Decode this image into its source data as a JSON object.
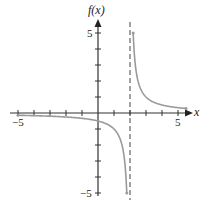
{
  "chart_data": {
    "type": "line",
    "title": "",
    "function": "f(x) = 1/(x - 2)",
    "xlabel": "x",
    "ylabel": "f(x)",
    "xlim": [
      -5,
      5
    ],
    "ylim": [
      -5,
      5
    ],
    "x_tick_labels": [
      "-5",
      "5"
    ],
    "y_tick_labels": [
      "5",
      "-5"
    ],
    "x_ticks": [
      -5,
      -4,
      -3,
      -2,
      -1,
      1,
      2,
      3,
      4,
      5
    ],
    "y_ticks": [
      -5,
      -4,
      -3,
      -2,
      -1,
      1,
      2,
      3,
      4,
      5
    ],
    "grid": false,
    "vertical_asymptote": 2,
    "horizontal_asymptote": 0,
    "series": [
      {
        "name": "left branch",
        "x": [
          -5,
          -3,
          -1,
          0,
          1,
          1.5,
          1.8
        ],
        "y": [
          -0.143,
          -0.2,
          -0.333,
          -0.5,
          -1,
          -2,
          -5
        ]
      },
      {
        "name": "right branch",
        "x": [
          2.2,
          2.5,
          3,
          4,
          5
        ],
        "y": [
          5,
          2,
          1,
          0.5,
          0.333
        ]
      }
    ],
    "curve_color": "#9a9a9a",
    "axis_color": "#333333"
  },
  "labels": {
    "y_axis": "f(x)",
    "x_axis": "x",
    "x_min": "−5",
    "x_max": "5",
    "y_max": "5",
    "y_min": "−5"
  }
}
